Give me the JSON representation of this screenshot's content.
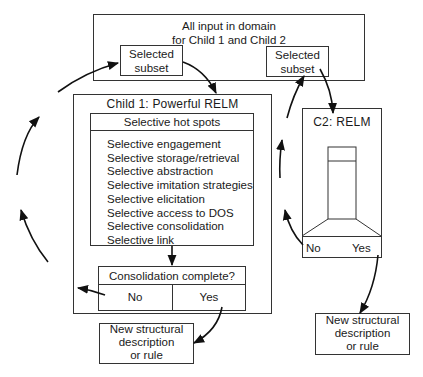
{
  "top_box": {
    "title": "All input in domain\nfor Child 1 and Child 2",
    "subset_left": "Selected\nsubset",
    "subset_right": "Selected\nsubset"
  },
  "child1": {
    "title": "Child 1:  Powerful RELM",
    "hot_spots": {
      "header": "Selective hot spots",
      "items": [
        "Selective engagement",
        "Selective storage/retrieval",
        "Selective abstraction",
        "Selective imitation strategies",
        "Selective elicitation",
        "Selective access to DOS",
        "Selective consolidation",
        "Selective link"
      ]
    },
    "decision": {
      "question": "Consolidation complete?",
      "no": "No",
      "yes": "Yes"
    },
    "output": "New structural\ndescription\nor rule"
  },
  "child2": {
    "title": "C2:  RELM",
    "no": "No",
    "yes": "Yes",
    "output": "New structural\ndescription\nor rule"
  }
}
